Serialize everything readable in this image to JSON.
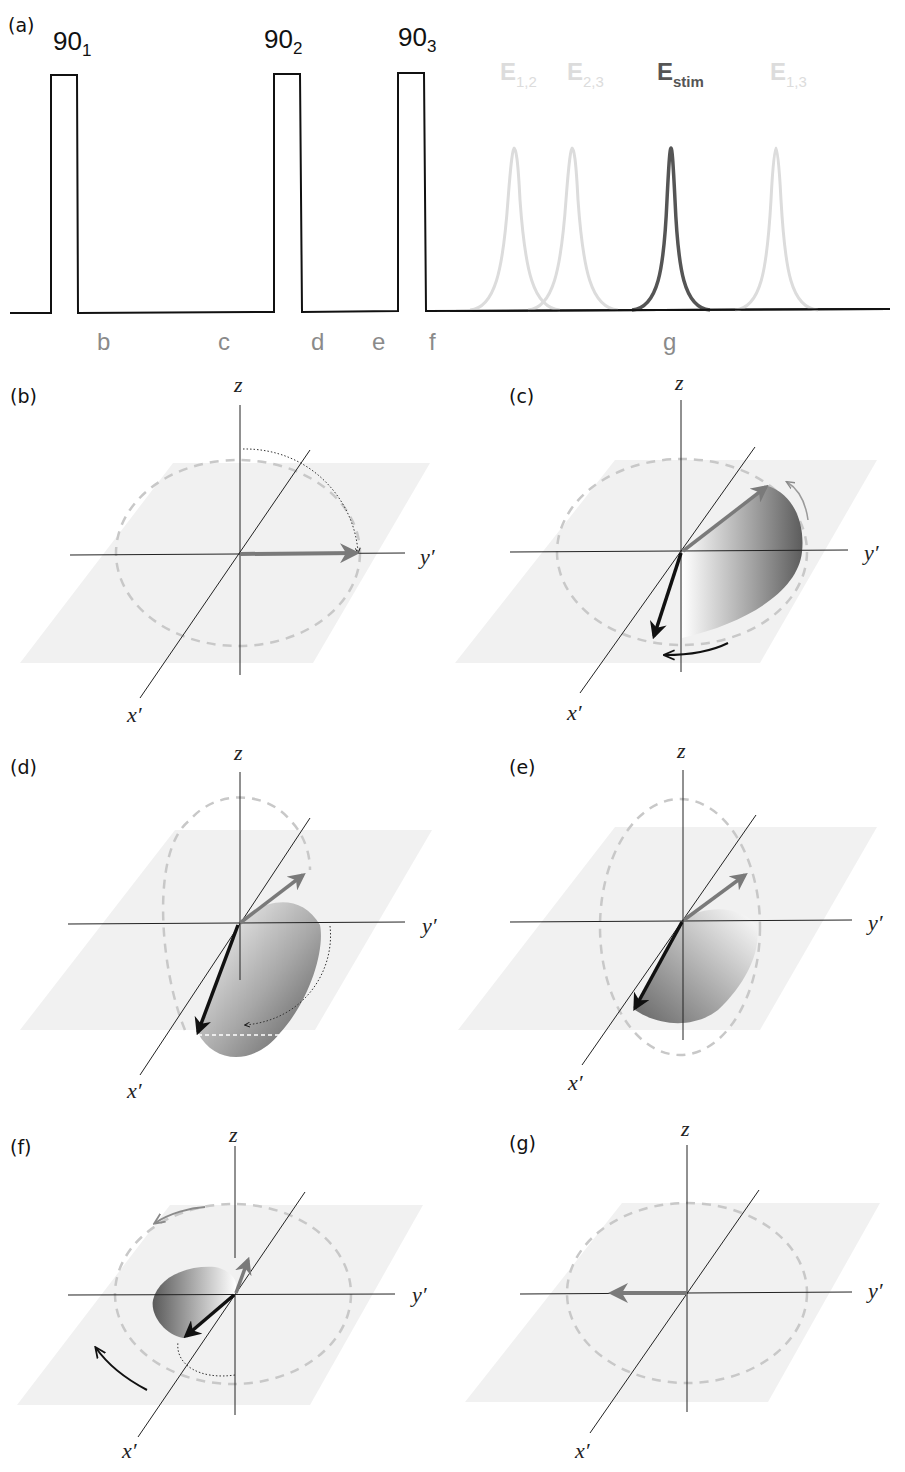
{
  "figure": {
    "panel_a": {
      "label": "(a)",
      "pulses": [
        {
          "base": "90",
          "sub": "1"
        },
        {
          "base": "90",
          "sub": "2"
        },
        {
          "base": "90",
          "sub": "3"
        }
      ],
      "echoes": [
        {
          "base": "E",
          "sub": "1,2",
          "emphasis": false
        },
        {
          "base": "E",
          "sub": "2,3",
          "emphasis": false
        },
        {
          "base": "E",
          "sub": "stim",
          "emphasis": true
        },
        {
          "base": "E",
          "sub": "1,3",
          "emphasis": false
        }
      ],
      "time_points": [
        "b",
        "c",
        "d",
        "e",
        "f",
        "g"
      ]
    },
    "vector_panels": [
      {
        "label": "(b)",
        "z": "z",
        "x": "x′",
        "y": "y′"
      },
      {
        "label": "(c)",
        "z": "z",
        "x": "x′",
        "y": "y′"
      },
      {
        "label": "(d)",
        "z": "z",
        "x": "x′",
        "y": "y′"
      },
      {
        "label": "(e)",
        "z": "z",
        "x": "x′",
        "y": "y′"
      },
      {
        "label": "(f)",
        "z": "z",
        "x": "x′",
        "y": "y′"
      },
      {
        "label": "(g)",
        "z": "z",
        "x": "x′",
        "y": "y′"
      }
    ],
    "colors": {
      "line": "#111111",
      "echo_faint": "#dcdcdc",
      "echo_stim": "#555555",
      "time_label": "#8a8a8a",
      "plane": "#f1f1f1",
      "dashed_circle": "#c8c8c8",
      "vector_gray": "#7a7a7a",
      "vector_black": "#111111"
    }
  }
}
